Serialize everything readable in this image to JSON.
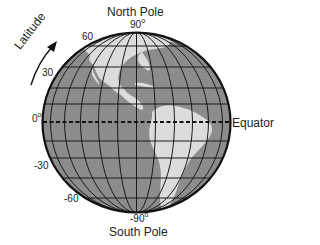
{
  "labels": {
    "north_pole": "North Pole",
    "south_pole": "South Pole",
    "equator": "Equator",
    "latitude_axis": "Latitude"
  },
  "latitude_ticks": [
    {
      "value": "90",
      "degree": "o"
    },
    {
      "value": "60",
      "degree": ""
    },
    {
      "value": "30",
      "degree": ""
    },
    {
      "value": "0",
      "degree": "o"
    },
    {
      "value": "-30",
      "degree": ""
    },
    {
      "value": "-60",
      "degree": ""
    },
    {
      "value": "-90",
      "degree": "o"
    }
  ],
  "colors": {
    "ocean": "#8c8c8c",
    "land": "#dcdcdc",
    "grid": "#1a1a1a",
    "outline": "#111111",
    "text": "#222222"
  }
}
